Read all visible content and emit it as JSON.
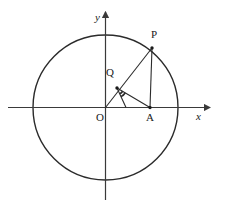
{
  "figure": {
    "kind": "geometry-diagram",
    "width": 229,
    "height": 212,
    "background_color": "#ffffff",
    "stroke_color": "#2b2b2b",
    "axis_color": "#3a3a3a",
    "label_color": "#1a1a1a"
  },
  "axes": {
    "x_label": "x",
    "y_label": "y",
    "origin_label": "O",
    "x_axis": {
      "x1": 8,
      "y1": 107.5,
      "x2": 210,
      "y2": 107.5
    },
    "y_axis": {
      "x1": 105.5,
      "y1": 200,
      "x2": 105.5,
      "y2": 12
    },
    "arrow_size": 5
  },
  "circle": {
    "center_x": 105.5,
    "center_y": 107.5,
    "radius": 72.5,
    "stroke_width": 1.4
  },
  "points": [
    {
      "name": "O",
      "label": "O",
      "x": 105.5,
      "y": 107.5,
      "label_x": 96,
      "label_y": 112,
      "dot": false
    },
    {
      "name": "P",
      "label": "P",
      "x": 152,
      "y": 48,
      "label_x": 151,
      "label_y": 30,
      "dot": true
    },
    {
      "name": "Q",
      "label": "Q",
      "x": 117,
      "y": 88,
      "label_x": 106,
      "label_y": 68,
      "dot": true
    },
    {
      "name": "A",
      "label": "A",
      "x": 150,
      "y": 107.5,
      "label_x": 146,
      "label_y": 112,
      "dot": true
    },
    {
      "name": "H",
      "label": "",
      "x": 126,
      "y": 107.5,
      "label_x": 0,
      "label_y": 0,
      "dot": false
    }
  ],
  "segments": [
    {
      "name": "OP",
      "from": "O",
      "to": "P",
      "x1": 105.5,
      "y1": 107.5,
      "x2": 152,
      "y2": 48
    },
    {
      "name": "PA",
      "from": "P",
      "to": "A",
      "x1": 152,
      "y1": 48,
      "x2": 150,
      "y2": 107.5
    },
    {
      "name": "QA",
      "from": "Q",
      "to": "A",
      "x1": 117,
      "y1": 88,
      "x2": 150,
      "y2": 107.5
    },
    {
      "name": "QH",
      "from": "Q",
      "to": "H",
      "x1": 117,
      "y1": 88,
      "x2": 126,
      "y2": 107.5
    }
  ],
  "angle_marks": [
    {
      "name": "angle-mark-1",
      "cx": 117,
      "cy": 88,
      "r": 6.5,
      "start_deg": 30,
      "end_deg": 65
    },
    {
      "name": "angle-mark-2",
      "cx": 117,
      "cy": 88,
      "r": 9.5,
      "start_deg": 30,
      "end_deg": 65
    }
  ]
}
